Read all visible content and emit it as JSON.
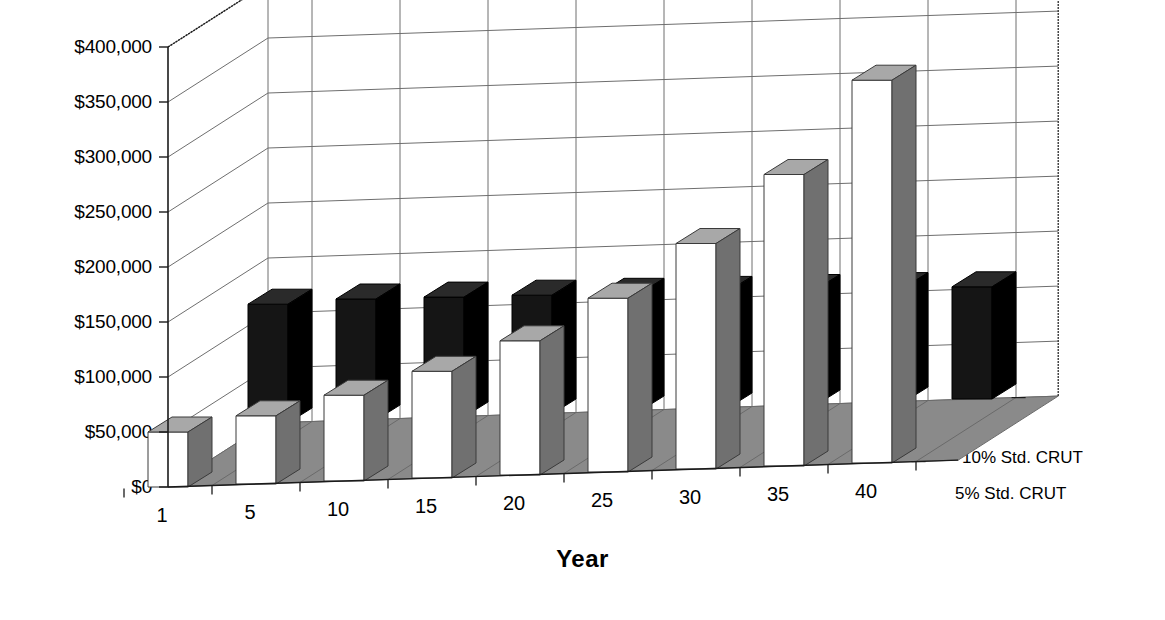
{
  "chart_data": {
    "type": "bar",
    "title": "",
    "subtitle": "",
    "xlabel": "Year",
    "ylabel": "",
    "categories": [
      "1",
      "5",
      "10",
      "15",
      "20",
      "25",
      "30",
      "35",
      "40"
    ],
    "ylim": [
      0,
      400000
    ],
    "ytick_labels": [
      "$400,000",
      "$350,000",
      "$300,000",
      "$250,000",
      "$200,000",
      "$150,000",
      "$100,000",
      "$50,000",
      "$0"
    ],
    "ytick_values": [
      400000,
      350000,
      300000,
      250000,
      200000,
      150000,
      100000,
      50000,
      0
    ],
    "ytick_step": 50000,
    "grid": true,
    "three_d": true,
    "legend_position": "right-depth-axis",
    "series": [
      {
        "name": "10% Std. CRUT",
        "row": "back",
        "color": "#151515",
        "values": [
          108000,
          110000,
          109000,
          108000,
          107000,
          106000,
          105000,
          104000,
          102000
        ]
      },
      {
        "name": "5% Std. CRUT",
        "row": "front",
        "color": "#ffffff",
        "values": [
          50000,
          62000,
          78000,
          97000,
          122000,
          158000,
          205000,
          265000,
          348000
        ]
      }
    ]
  },
  "axes": {
    "y": {
      "ticks": [
        {
          "label": "$400,000",
          "value": 400000
        },
        {
          "label": "$350,000",
          "value": 350000
        },
        {
          "label": "$300,000",
          "value": 300000
        },
        {
          "label": "$250,000",
          "value": 250000
        },
        {
          "label": "$200,000",
          "value": 200000
        },
        {
          "label": "$150,000",
          "value": 150000
        },
        {
          "label": "$100,000",
          "value": 100000
        },
        {
          "label": "$50,000",
          "value": 50000
        },
        {
          "label": "$0",
          "value": 0
        }
      ]
    },
    "x": {
      "title": "Year",
      "ticks": [
        "1",
        "5",
        "10",
        "15",
        "20",
        "25",
        "30",
        "35",
        "40"
      ]
    },
    "z": {
      "labels": [
        "10% Std. CRUT",
        "5% Std. CRUT"
      ]
    }
  },
  "colors": {
    "background": "#ffffff",
    "bar_front_face": "#ffffff",
    "bar_front_top": "#a8a8a8",
    "bar_front_side": "#707070",
    "bar_back_face": "#151515",
    "bar_back_top": "#2a2a2a",
    "bar_back_side": "#000000",
    "floor": "#8a8a8a",
    "floor_edge": "#6a6a6a",
    "wall": "#ffffff",
    "gridline": "#6e6e6e",
    "axis_line": "#1a1a1a",
    "text": "#000000"
  }
}
